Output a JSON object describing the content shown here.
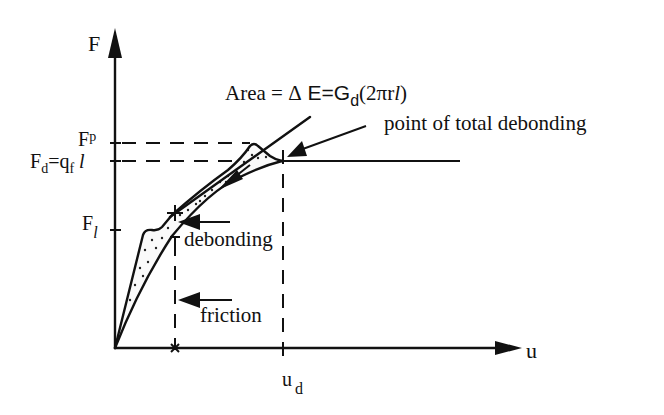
{
  "diagram": {
    "type": "force-displacement schematic (fiber pull-out)",
    "axes": {
      "y_label": "F",
      "x_label": "u"
    },
    "y_ticks": {
      "fp": {
        "main": "F",
        "sub": "p"
      },
      "fd": {
        "main": "F",
        "sub": "d",
        "eq": "=q",
        "eq_sub": "f",
        "tail": " l"
      },
      "fl": {
        "main": "F",
        "sub": "l"
      }
    },
    "x_ticks": {
      "ud": {
        "main": "u",
        "sub": "d"
      }
    },
    "annotations": {
      "area_prefix": "Area = ",
      "area_delta": "Δ",
      "area_e": " E=G",
      "area_sub": "d",
      "area_paren": "(2πr",
      "area_l": "l",
      "area_close": ")",
      "total_debonding": "point of total debonding",
      "debonding": "debonding",
      "friction": "friction"
    },
    "colors": {
      "ink": "#111111",
      "background": "#ffffff"
    }
  }
}
